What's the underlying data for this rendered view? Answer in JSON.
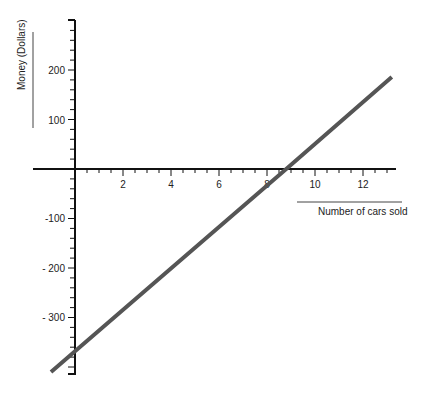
{
  "chart_data": {
    "type": "line",
    "title": "",
    "xlabel": "Number of cars sold",
    "ylabel": "Money (Dollars)",
    "x_ticks": [
      "2",
      "4",
      "6",
      "8",
      "10",
      "12"
    ],
    "y_ticks": [
      "200",
      "100",
      "-100",
      "- 200",
      "- 300"
    ],
    "xlim": [
      -1.7,
      13.5
    ],
    "ylim": [
      -410,
      300
    ],
    "grid": false,
    "legend": null,
    "series": [
      {
        "name": "Money",
        "x": [
          -1,
          0,
          8.8,
          13.2
        ],
        "y": [
          -410,
          -368,
          0,
          186
        ]
      }
    ],
    "line_color": "#555555"
  }
}
